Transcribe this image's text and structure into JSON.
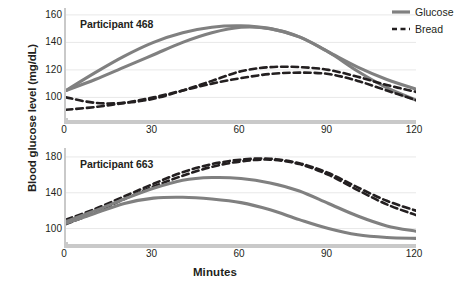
{
  "chart_data": {
    "type": "line",
    "title": "",
    "xlabel": "Minutes",
    "ylabel": "Blood glucose level (mg/dL)",
    "legend": {
      "position": "top-right",
      "entries": [
        {
          "name": "Glucose",
          "style": "solid",
          "color": "#808080"
        },
        {
          "name": "Bread",
          "style": "dashed",
          "color": "#231f20"
        }
      ]
    },
    "grid": true,
    "panels": [
      {
        "label": "Participant 468",
        "xlim": [
          0,
          120
        ],
        "ylim": [
          85,
          165
        ],
        "xticks": [
          0,
          30,
          60,
          90,
          120
        ],
        "yticks": [
          100,
          120,
          140,
          160
        ],
        "x": [
          0,
          10,
          20,
          30,
          40,
          50,
          60,
          70,
          80,
          90,
          100,
          110,
          120
        ],
        "series": [
          {
            "name": "Glucose",
            "style": "solid",
            "color": "#808080",
            "values": [
              105,
              118,
              130,
              140,
              147,
              151,
              152,
              150,
              144,
              133,
              122,
              113,
              106
            ]
          },
          {
            "name": "Glucose",
            "style": "solid",
            "color": "#808080",
            "values": [
              105,
              113,
              122,
              131,
              140,
              147,
              151,
              150,
              144,
              133,
              119,
              107,
              98
            ]
          },
          {
            "name": "Bread",
            "style": "dashed",
            "color": "#231f20",
            "values": [
              100,
              96,
              96,
              99,
              105,
              112,
              119,
              122,
              122,
              120,
              115,
              109,
              104
            ]
          },
          {
            "name": "Bread",
            "style": "dashed",
            "color": "#231f20",
            "values": [
              91,
              93,
              96,
              100,
              105,
              110,
              114,
              117,
              118,
              117,
              112,
              105,
              98
            ]
          }
        ]
      },
      {
        "label": "Participant 663",
        "xlim": [
          0,
          120
        ],
        "ylim": [
          85,
          190
        ],
        "xticks": [
          0,
          30,
          60,
          90,
          120
        ],
        "yticks": [
          100,
          140,
          180
        ],
        "x": [
          0,
          10,
          20,
          30,
          40,
          50,
          60,
          70,
          80,
          90,
          100,
          110,
          120
        ],
        "series": [
          {
            "name": "Bread",
            "style": "dashed",
            "color": "#231f20",
            "values": [
              110,
              122,
              136,
              150,
              163,
              172,
              177,
              178,
              173,
              162,
              146,
              131,
              120
            ]
          },
          {
            "name": "Bread",
            "style": "dashed",
            "color": "#231f20",
            "values": [
              105,
              118,
              133,
              147,
              159,
              169,
              175,
              177,
              172,
              160,
              143,
              127,
              115
            ]
          },
          {
            "name": "Glucose",
            "style": "solid",
            "color": "#808080",
            "values": [
              108,
              120,
              133,
              145,
              154,
              157,
              156,
              151,
              142,
              128,
              114,
              103,
              97
            ]
          },
          {
            "name": "Glucose",
            "style": "solid",
            "color": "#808080",
            "values": [
              106,
              117,
              128,
              134,
              135,
              133,
              129,
              121,
              110,
              100,
              93,
              90,
              89
            ]
          }
        ]
      }
    ]
  }
}
